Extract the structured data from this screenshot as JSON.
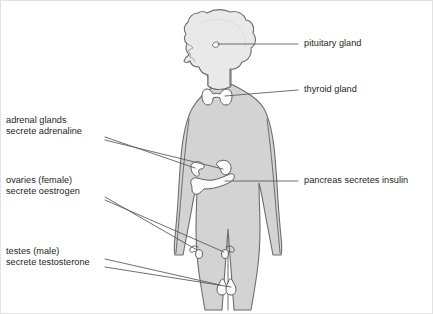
{
  "diagram": {
    "colors": {
      "body_fill": "#d3d3d3",
      "body_stroke": "#6d6d6d",
      "head_fill": "#e9e9e9",
      "organ_fill": "#fbfbfb",
      "organ_stroke": "#5e5e5e",
      "leader_line": "#555555",
      "text": "#231f20",
      "background": "#ffffff",
      "border": "#e2e2e2"
    },
    "labels": {
      "pituitary": {
        "lines": [
          "pituitary gland"
        ]
      },
      "thyroid": {
        "lines": [
          "thyroid gland"
        ]
      },
      "pancreas": {
        "lines": [
          "pancreas secretes insulin"
        ]
      },
      "adrenal": {
        "lines": [
          "adrenal glands",
          "secrete adrenaline"
        ]
      },
      "ovaries": {
        "lines": [
          "ovaries (female)",
          "secrete oestrogen"
        ]
      },
      "testes": {
        "lines": [
          "testes (male)",
          "secrete testosterone"
        ]
      }
    },
    "organs": {
      "pituitary_name": "pituitary-gland",
      "thyroid_name": "thyroid-gland",
      "adrenal_left_name": "adrenal-gland-left",
      "adrenal_right_name": "adrenal-gland-right",
      "pancreas_name": "pancreas",
      "ovary_left_name": "ovary-left",
      "ovary_right_name": "ovary-right",
      "testis_left_name": "testis-left",
      "testis_right_name": "testis-right"
    }
  }
}
